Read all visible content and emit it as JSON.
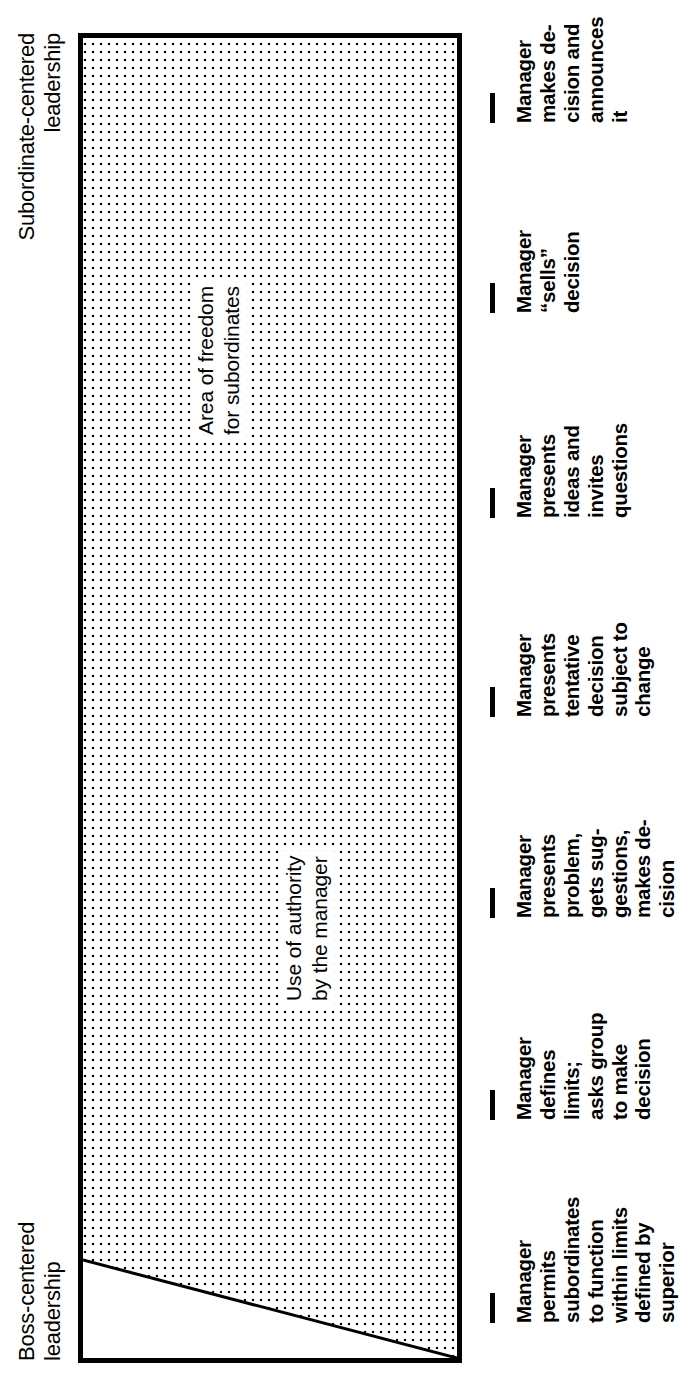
{
  "figure": {
    "axis_left_caption": "Boss-centered\nleadership",
    "axis_right_caption": "Subordinate-centered\nleadership",
    "region_left_label": "Use of authority\nby the manager",
    "region_right_label": "Area of freedom\nfor subordinates",
    "line_color": "#000000",
    "fill_pattern": "stipple-dots",
    "background": "#ffffff"
  },
  "continuum": {
    "tick_count": 7,
    "steps": [
      {
        "index": 1,
        "label": "Manager\nmakes de-\ncision and\nannounces\nit"
      },
      {
        "index": 2,
        "label": "Manager\n“sells”\ndecision"
      },
      {
        "index": 3,
        "label": "Manager\npresents\nideas and\ninvites\nquestions"
      },
      {
        "index": 4,
        "label": "Manager\npresents\ntentative\ndecision\nsubject to\nchange"
      },
      {
        "index": 5,
        "label": "Manager\npresents\nproblem,\ngets sug-\ngestions,\nmakes de-\ncision"
      },
      {
        "index": 6,
        "label": "Manager\ndefines\nlimits;\nasks group\nto make\ndecision"
      },
      {
        "index": 7,
        "label": "Manager\npermits\nsubordinates\nto function\nwithin limits\ndefined by\nsuperior"
      }
    ]
  },
  "chart_data": {
    "type": "area",
    "xlabel": "",
    "ylabel": "",
    "categories": [
      "Manager makes decision and announces it",
      "Manager “sells” decision",
      "Manager presents ideas and invites questions",
      "Manager presents tentative decision subject to change",
      "Manager presents problem, gets suggestions, makes decision",
      "Manager defines limits; asks group to make decision",
      "Manager permits subordinates to function within limits defined by superior"
    ],
    "series": [
      {
        "name": "Use of authority by the manager",
        "values": [
          100,
          84,
          68,
          52,
          36,
          20,
          7
        ]
      },
      {
        "name": "Area of freedom for subordinates",
        "values": [
          0,
          16,
          32,
          48,
          64,
          80,
          93
        ]
      }
    ],
    "ylim": [
      0,
      100
    ],
    "grid": false,
    "legend": "inline-annotations",
    "annotations": [
      "Boss-centered leadership",
      "Subordinate-centered leadership"
    ]
  }
}
